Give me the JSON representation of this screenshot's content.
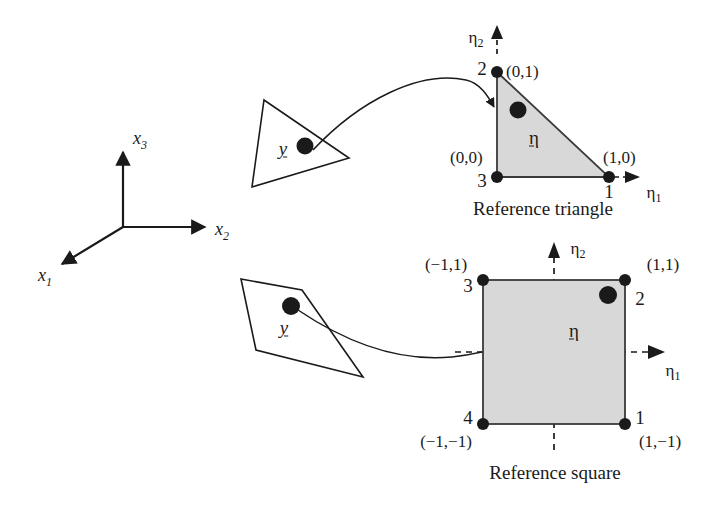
{
  "figure": {
    "colors": {
      "fill_gray": "#d8d8d8",
      "stroke": "#1a1a1a",
      "node": "#1a1a1a",
      "background": "#ffffff"
    }
  },
  "global_axes": {
    "name": "physical-cartesian-axes",
    "origin_label": "",
    "axes": [
      {
        "id": "x1",
        "label": "x",
        "sub": "1"
      },
      {
        "id": "x2",
        "label": "x",
        "sub": "2"
      },
      {
        "id": "x3",
        "label": "x",
        "sub": "3"
      }
    ]
  },
  "triangle_panel": {
    "caption": "Reference triangle",
    "physical_element": {
      "vector_label": "y",
      "shape": "triangle"
    },
    "axis_eta1": {
      "label": "η",
      "sub": "1"
    },
    "axis_eta2": {
      "label": "η",
      "sub": "2"
    },
    "mapped_point_label": "η",
    "nodes": [
      {
        "number": "1",
        "coord": "(1,0)"
      },
      {
        "number": "2",
        "coord": "(0,1)"
      },
      {
        "number": "3",
        "coord": "(0,0)"
      }
    ]
  },
  "square_panel": {
    "caption": "Reference square",
    "physical_element": {
      "vector_label": "y",
      "shape": "quadrilateral"
    },
    "axis_eta1": {
      "label": "η",
      "sub": "1"
    },
    "axis_eta2": {
      "label": "η",
      "sub": "2"
    },
    "mapped_point_label": "η",
    "nodes": [
      {
        "number": "1",
        "coord": "(1,−1)"
      },
      {
        "number": "2",
        "coord": "(1,1)"
      },
      {
        "number": "3",
        "coord": "(−1,1)"
      },
      {
        "number": "4",
        "coord": "(−1,−1)"
      }
    ]
  }
}
